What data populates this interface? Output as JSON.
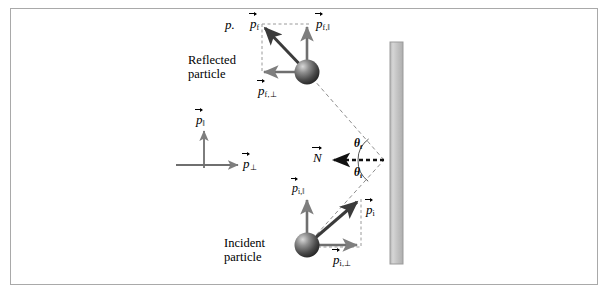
{
  "figure": {
    "background_color": "#ffffff",
    "border_color": "#a9a9a9"
  },
  "wall": {
    "name": "wall",
    "fill_color": "#c0c0c0",
    "edge_color": "#9a9a9a"
  },
  "captions": {
    "reflected_line1": "Reflected",
    "reflected_line2": "particle",
    "incident_line1": "Incident",
    "incident_line2": "particle"
  },
  "legend": {
    "parallel": "p",
    "parallel_sub": "‖",
    "perp": "p",
    "perp_sub": "⊥"
  },
  "labels": {
    "stray_p": "p.",
    "p_f": "p",
    "p_f_sub": "f",
    "p_f_par": "p",
    "p_f_par_sub": "f,‖",
    "p_f_perp": "p",
    "p_f_perp_sub": "f,⊥",
    "p_i": "p",
    "p_i_sub": "i",
    "p_i_par": "p",
    "p_i_par_sub": "i,‖",
    "p_i_perp": "p",
    "p_i_perp_sub": "i,⊥",
    "normal": "N",
    "theta_f": "θ",
    "theta_f_sub": "f",
    "theta_i": "θ",
    "theta_i_sub": "i"
  },
  "colors": {
    "vector_dark": "#3b3b3b",
    "vector_gray": "#8c8c8c",
    "dashed": "#808080",
    "sphere_dark": "#2e2e2e",
    "sphere_mid": "#6e6e6e",
    "sphere_light": "#d8d8d8"
  },
  "geometry": {
    "wall_x": 390,
    "wall_y_top": 42,
    "wall_width": 13,
    "wall_height": 222,
    "impact_point": [
      384,
      160
    ],
    "reflected_particle_center": [
      307,
      72
    ],
    "incident_particle_center": [
      307,
      245
    ],
    "reflected_tip": [
      262,
      27
    ],
    "incident_tip": [
      360,
      205
    ]
  }
}
